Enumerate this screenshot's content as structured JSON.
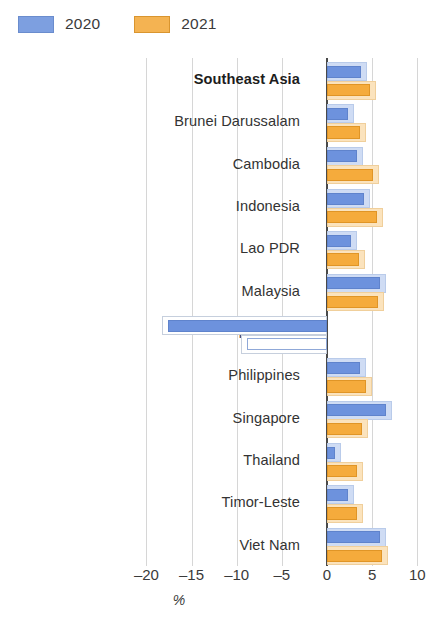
{
  "legend": {
    "position": "top-left",
    "entries": [
      {
        "label": "2020",
        "color": "#6d92dd",
        "key": "v2020"
      },
      {
        "label": "2021",
        "color": "#f5ab3c",
        "key": "v2021"
      }
    ]
  },
  "axis": {
    "title": "%",
    "ticks": [
      "–20",
      "–15",
      "–10",
      "–5",
      "0",
      "5",
      "10"
    ],
    "tick_values": [
      -20,
      -15,
      -10,
      -5,
      0,
      5,
      10
    ]
  },
  "chart_data": {
    "type": "bar",
    "orientation": "horizontal",
    "title": "",
    "subtitle": "",
    "xlabel": "%",
    "ylabel": "",
    "xlim": [
      -20,
      10
    ],
    "grid": true,
    "legend_position": "top-left",
    "categories": [
      "Southeast Asia",
      "Brunei Darussalam",
      "Cambodia",
      "Indonesia",
      "Lao PDR",
      "Malaysia",
      "Myanmar",
      "Philippines",
      "Singapore",
      "Thailand",
      "Timor-Leste",
      "Viet Nam"
    ],
    "highlighted_category": "Southeast Asia",
    "series": [
      {
        "name": "2020",
        "color": "#6d92dd",
        "values": [
          4.4,
          3.0,
          4.0,
          4.8,
          3.3,
          6.5,
          -18.3,
          4.3,
          7.2,
          1.5,
          3.0,
          6.5
        ]
      },
      {
        "name": "2021",
        "color": "#f5ab3c",
        "values": [
          5.4,
          4.3,
          5.8,
          6.2,
          4.2,
          6.3,
          -9.5,
          5.0,
          4.5,
          4.0,
          4.0,
          6.8
        ]
      }
    ]
  }
}
